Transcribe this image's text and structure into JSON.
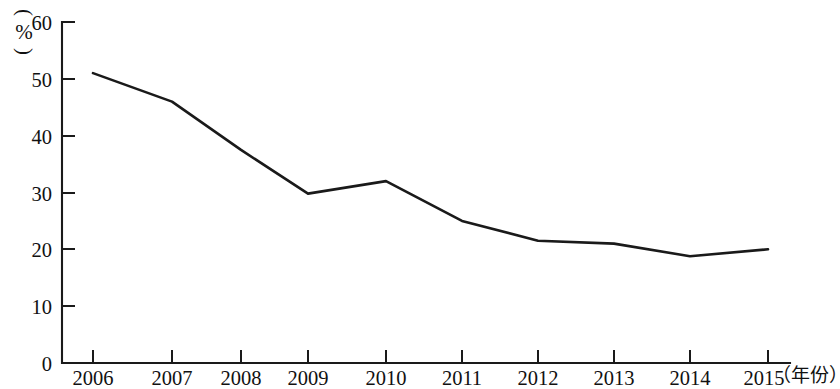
{
  "chart_data": {
    "type": "line",
    "title": "",
    "subtitle": "",
    "xlabel": "（年份）",
    "ylabel": "(%)",
    "categories": [
      "2006",
      "2007",
      "2008",
      "2009",
      "2010",
      "2011",
      "2012",
      "2013",
      "2014",
      "2015"
    ],
    "series": [
      {
        "name": "",
        "values": [
          51,
          46,
          37.5,
          29.8,
          32,
          25,
          21.5,
          21,
          18.8,
          20
        ]
      }
    ],
    "ylim": [
      0,
      60
    ],
    "y_ticks": [
      "0",
      "10",
      "20",
      "30",
      "40",
      "50",
      "60"
    ],
    "y_tick_values": [
      0,
      10,
      20,
      30,
      40,
      50,
      60
    ],
    "x_tick_labels": [
      "2006",
      "2007",
      "2008",
      "2009",
      "2010",
      "2011",
      "2012",
      "2013",
      "2014",
      "2015"
    ],
    "grid": false,
    "legend": "none",
    "line_color": "#1a1a1a",
    "axis_color": "#1a1a1a",
    "background_color": "#ffffff",
    "markers": false
  },
  "axis": {
    "y_unit_open_paren": "(",
    "y_unit_symbol": "%",
    "y_unit_close_paren": ")",
    "x_unit_text": "（年份）"
  }
}
